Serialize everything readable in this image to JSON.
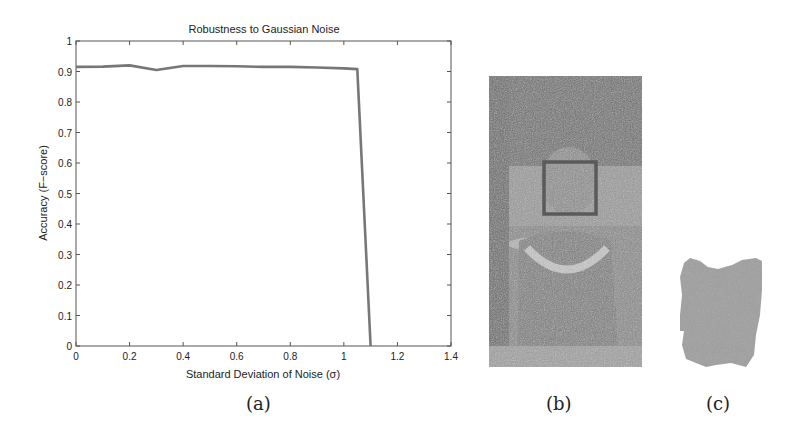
{
  "chart_data": {
    "type": "line",
    "title": "Robustness to Gaussian Noise",
    "xlabel": "Standard Deviation of Noise (σ)",
    "ylabel": "Accuracy (F−score)",
    "xlim": [
      0,
      1.4
    ],
    "ylim": [
      0,
      1
    ],
    "xticks": [
      "0",
      "0.2",
      "0.4",
      "0.6",
      "0.8",
      "1",
      "1.2",
      "1.4"
    ],
    "yticks": [
      "0",
      "0.1",
      "0.2",
      "0.3",
      "0.4",
      "0.5",
      "0.6",
      "0.7",
      "0.8",
      "0.9",
      "1"
    ],
    "grid": false,
    "legend": null,
    "series": [
      {
        "name": "F-score",
        "x": [
          0,
          0.1,
          0.2,
          0.3,
          0.4,
          0.5,
          0.6,
          0.7,
          0.8,
          0.9,
          1.0,
          1.05,
          1.1
        ],
        "y": [
          0.915,
          0.916,
          0.92,
          0.905,
          0.918,
          0.918,
          0.917,
          0.915,
          0.915,
          0.913,
          0.91,
          0.908,
          0.0
        ]
      }
    ]
  },
  "captions": {
    "a": "(a)",
    "b": "(b)",
    "c": "(c)"
  },
  "panels": {
    "b": {
      "description": "Noisy photo of a person with detected face bounding box"
    },
    "c": {
      "description": "Segmented skin/face region mask"
    }
  }
}
